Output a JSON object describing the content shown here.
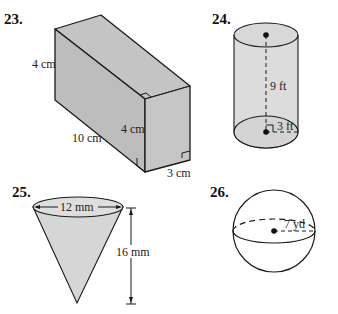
{
  "problems": [
    {
      "number": "23.",
      "shape": "rectangular-prism",
      "labels": {
        "height": "4 cm",
        "length": "10 cm",
        "front_height": "4 cm",
        "width": "3 cm"
      }
    },
    {
      "number": "24.",
      "shape": "cylinder",
      "labels": {
        "height": "9 ft",
        "radius": "3 ft"
      }
    },
    {
      "number": "25.",
      "shape": "cone",
      "labels": {
        "diameter": "12 mm",
        "height": "16 mm"
      }
    },
    {
      "number": "26.",
      "shape": "sphere",
      "labels": {
        "radius": "7 yd"
      }
    }
  ],
  "colors": {
    "fill": "#c8c8c8",
    "light_fill": "#e2e2e2",
    "stroke": "#1a1a1a"
  }
}
